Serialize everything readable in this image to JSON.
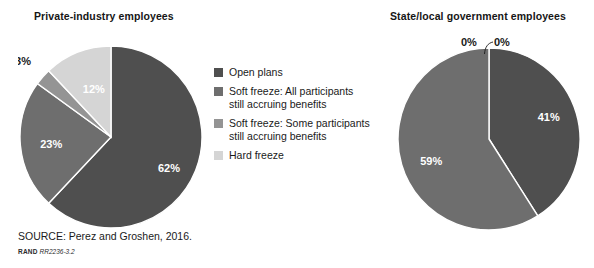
{
  "source": {
    "note": "SOURCE: Perez and Groshen, 2016.",
    "rand_mark": "RAND",
    "rand_id": "RR2236-3.2"
  },
  "legend": {
    "items": [
      {
        "label": "Open plans",
        "color": "#4f4f4f",
        "icon": "legend-swatch-icon"
      },
      {
        "label": "Soft freeze: All participants\nstill accruing benefits",
        "color": "#6e6e6e",
        "icon": "legend-swatch-icon"
      },
      {
        "label": "Soft freeze: Some participants\nstill accruing benefits",
        "color": "#949494",
        "icon": "legend-swatch-icon"
      },
      {
        "label": "Hard freeze",
        "color": "#d5d5d5",
        "icon": "legend-swatch-icon"
      }
    ]
  },
  "callouts": {
    "zero_left": "0%",
    "zero_right": "0%"
  },
  "chart_data": [
    {
      "type": "pie",
      "title": "Private-industry employees",
      "categories": [
        "Open plans",
        "Soft freeze: All participants still accruing benefits",
        "Soft freeze: Some participants still accruing benefits",
        "Hard freeze"
      ],
      "values": [
        62,
        23,
        3,
        12
      ],
      "labels": [
        "62%",
        "23%",
        "3%",
        "12%"
      ],
      "colors": [
        "#4f4f4f",
        "#6e6e6e",
        "#949494",
        "#d5d5d5"
      ],
      "label_colors": [
        "#ffffff",
        "#ffffff",
        "#1a1a1a",
        "#ffffff"
      ],
      "start_angle_deg": 0,
      "direction": "clockwise",
      "units": "percent",
      "legend_position": "center"
    },
    {
      "type": "pie",
      "title": "State/local government employees",
      "categories": [
        "Open plans",
        "Soft freeze: All participants still accruing benefits",
        "Soft freeze: Some participants still accruing benefits",
        "Hard freeze"
      ],
      "values": [
        41,
        59,
        0,
        0
      ],
      "labels": [
        "41%",
        "59%",
        "0%",
        "0%"
      ],
      "colors": [
        "#4f4f4f",
        "#6e6e6e",
        "#949494",
        "#d5d5d5"
      ],
      "label_colors": [
        "#ffffff",
        "#ffffff",
        "#1a1a1a",
        "#1a1a1a"
      ],
      "start_angle_deg": 0,
      "direction": "clockwise",
      "units": "percent",
      "legend_position": "center"
    }
  ]
}
